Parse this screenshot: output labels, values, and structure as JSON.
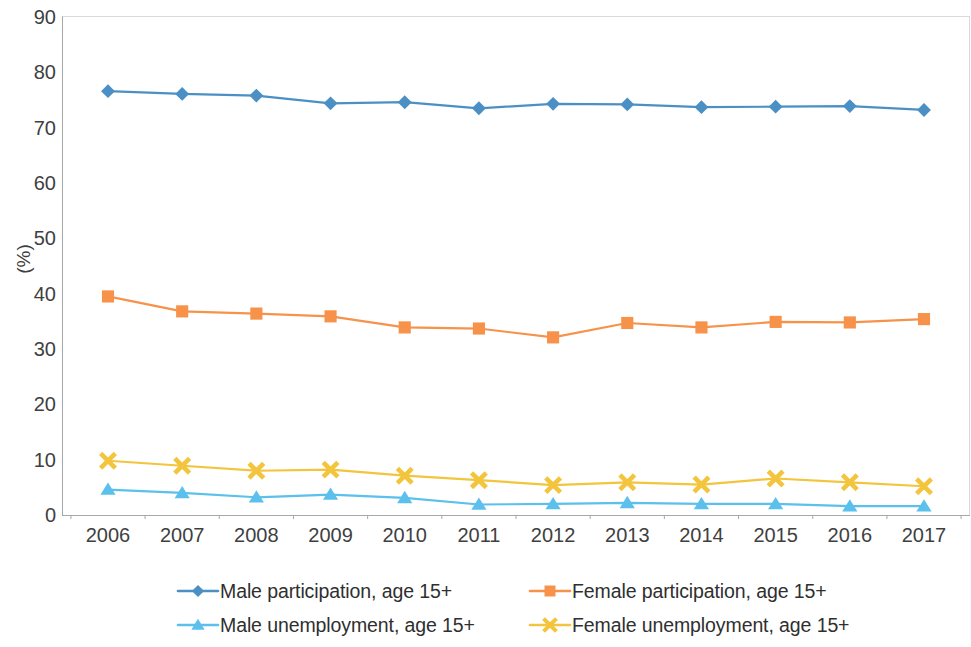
{
  "chart_data": {
    "type": "line",
    "title": "",
    "subtitle": "",
    "xlabel": "",
    "ylabel": "(%)",
    "categories": [
      "2006",
      "2007",
      "2008",
      "2009",
      "2010",
      "2011",
      "2012",
      "2013",
      "2014",
      "2015",
      "2016",
      "2017"
    ],
    "x": [
      2006,
      2007,
      2008,
      2009,
      2010,
      2011,
      2012,
      2013,
      2014,
      2015,
      2016,
      2017
    ],
    "xlim": [
      2006,
      2017
    ],
    "ylim": [
      0,
      90
    ],
    "y_ticks": [
      0,
      10,
      20,
      30,
      40,
      50,
      60,
      70,
      80,
      90
    ],
    "grid": false,
    "legend_position": "bottom",
    "series": [
      {
        "name": "Male participation, age 15+",
        "color": "#4A90C4",
        "marker": "diamond",
        "values": [
          76.6,
          76.1,
          75.8,
          74.4,
          74.6,
          73.5,
          74.3,
          74.2,
          73.7,
          73.8,
          73.9,
          73.2
        ]
      },
      {
        "name": "Female participation, age 15+",
        "color": "#F7924B",
        "marker": "square",
        "values": [
          39.5,
          36.8,
          36.4,
          35.9,
          33.9,
          33.7,
          32.1,
          34.7,
          33.9,
          34.9,
          34.8,
          35.4
        ]
      },
      {
        "name": "Male unemployment, age 15+",
        "color": "#5BC0EB",
        "marker": "triangle",
        "values": [
          4.6,
          4.0,
          3.2,
          3.7,
          3.1,
          1.9,
          2.0,
          2.2,
          2.0,
          2.0,
          1.6,
          1.6
        ]
      },
      {
        "name": "Female unemployment, age 15+",
        "color": "#F2C53D",
        "marker": "x",
        "values": [
          9.8,
          8.9,
          8.0,
          8.2,
          7.1,
          6.3,
          5.4,
          5.9,
          5.5,
          6.6,
          5.9,
          5.2
        ]
      }
    ]
  },
  "axes": {
    "y_title": "(%)",
    "y_tick_labels": [
      "90",
      "80",
      "70",
      "60",
      "50",
      "40",
      "30",
      "20",
      "10",
      "0"
    ],
    "x_tick_labels": [
      "2006",
      "2007",
      "2008",
      "2009",
      "2010",
      "2011",
      "2012",
      "2013",
      "2014",
      "2015",
      "2016",
      "2017"
    ]
  },
  "legend": {
    "items": [
      {
        "label": "Male participation, age 15+",
        "color": "#4A90C4",
        "marker": "diamond"
      },
      {
        "label": "Female participation, age 15+",
        "color": "#F7924B",
        "marker": "square"
      },
      {
        "label": "Male unemployment, age 15+",
        "color": "#5BC0EB",
        "marker": "triangle"
      },
      {
        "label": "Female unemployment, age 15+",
        "color": "#F2C53D",
        "marker": "x"
      }
    ]
  }
}
